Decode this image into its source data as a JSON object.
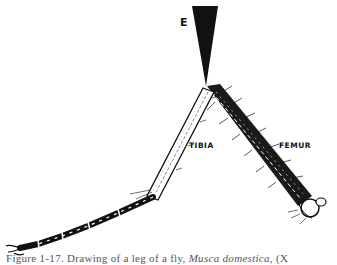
{
  "figure": {
    "labels": {
      "pointer": "E",
      "tibia": "TIBIA",
      "femur": "FEMUR"
    },
    "caption": {
      "prefix": "Figure 1-17. Drawing of a leg of a fly, ",
      "species": "Musca domestica",
      "suffix": ", (X"
    },
    "colors": {
      "ink": "#111111",
      "background": "#ffffff",
      "caption": "#555555"
    }
  }
}
